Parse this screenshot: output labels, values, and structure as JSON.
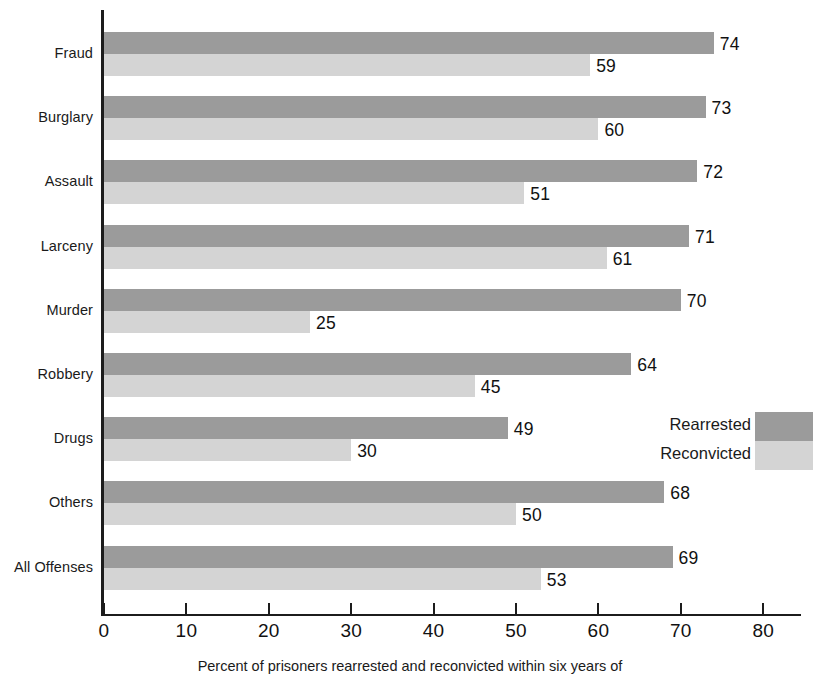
{
  "chart_data": {
    "type": "bar",
    "orientation": "horizontal",
    "title": "",
    "xlabel": "Percent of prisoners rearrested and reconvicted within six years of",
    "ylabel": "",
    "xlim": [
      0,
      85
    ],
    "grid": false,
    "legend_position": "middle-right",
    "categories": [
      "Fraud",
      "Burglary",
      "Assault",
      "Larceny",
      "Murder",
      "Robbery",
      "Drugs",
      "Others",
      "All Offenses"
    ],
    "series": [
      {
        "name": "Rearrested",
        "color": "#9b9b9b",
        "values": [
          74,
          73,
          72,
          71,
          70,
          64,
          49,
          68,
          69
        ]
      },
      {
        "name": "Reconvicted",
        "color": "#d4d4d4",
        "values": [
          59,
          60,
          51,
          61,
          25,
          45,
          30,
          50,
          53
        ]
      }
    ],
    "xticks": [
      0,
      10,
      20,
      30,
      40,
      50,
      60,
      70,
      80
    ],
    "xtick_labels": [
      "0",
      "10",
      "20",
      "30",
      "40",
      "50",
      "60",
      "70",
      "80"
    ]
  },
  "legend": {
    "items": [
      {
        "label": "Rearrested",
        "swatch": "dark"
      },
      {
        "label": "Reconvicted",
        "swatch": "light"
      }
    ]
  },
  "caption": {
    "text": "Percent of prisoners rearrested and reconvicted within six years of"
  }
}
